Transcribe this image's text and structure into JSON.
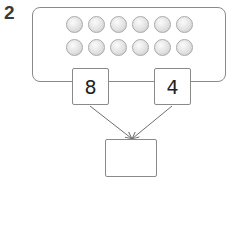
{
  "question": {
    "number": "2"
  },
  "counters": {
    "rows": 2,
    "per_row": 6,
    "total": 12,
    "color": "#d9d9d9"
  },
  "parts": [
    {
      "label": "part-left",
      "value": "8"
    },
    {
      "label": "part-right",
      "value": "4"
    }
  ],
  "whole": {
    "value": ""
  },
  "colors": {
    "border": "#8a8a8a",
    "arrow": "#6e6e6e",
    "text": "#222222"
  }
}
